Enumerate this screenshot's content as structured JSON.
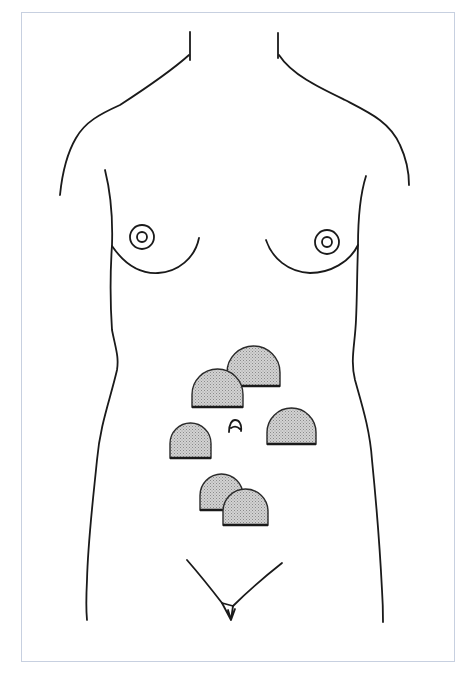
{
  "figure": {
    "frame_color": "#c7d0e0",
    "line_color": "#1a1a1a"
  },
  "colors": {
    "marker_fill": "#c9c9c9",
    "marker_stroke": "#2a2a2a",
    "marker_base": "#1a1a1a"
  },
  "markers": [
    {
      "id": "upper-left",
      "x": 192,
      "y": 369,
      "w": 51,
      "h": 38
    },
    {
      "id": "upper-right",
      "x": 227,
      "y": 346,
      "w": 53,
      "h": 40
    },
    {
      "id": "mid-left",
      "x": 170,
      "y": 423,
      "w": 41,
      "h": 35
    },
    {
      "id": "mid-right",
      "x": 267,
      "y": 408,
      "w": 49,
      "h": 36
    },
    {
      "id": "lower-left",
      "x": 200,
      "y": 474,
      "w": 43,
      "h": 36
    },
    {
      "id": "lower-right",
      "x": 223,
      "y": 489,
      "w": 45,
      "h": 36
    }
  ],
  "marker_count": 6
}
